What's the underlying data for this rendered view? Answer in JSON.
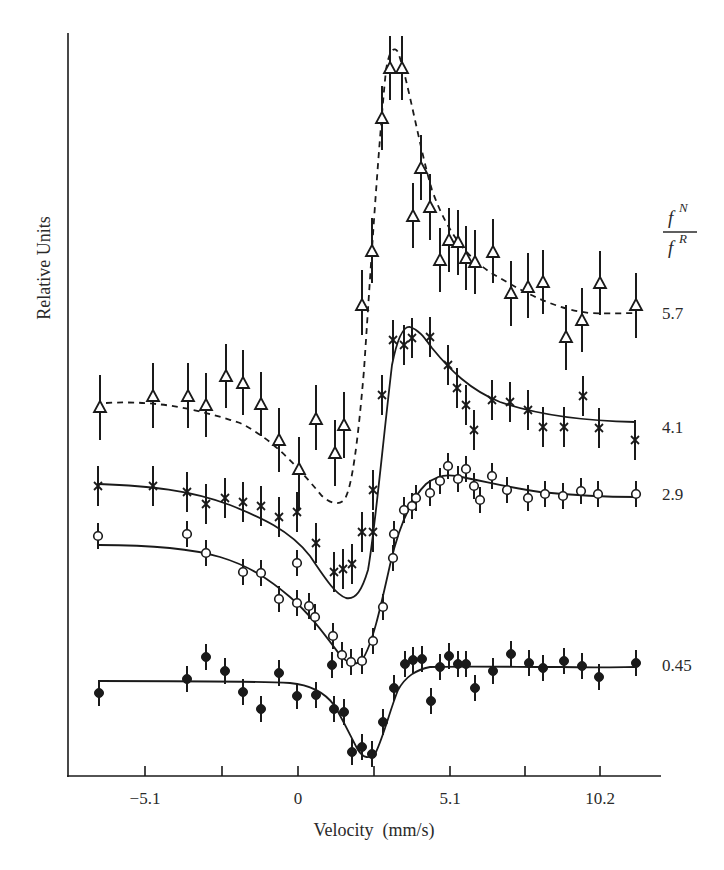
{
  "chart_data": {
    "type": "scatter",
    "title": "",
    "xlabel": "Velocity  (mm/s)",
    "ylabel": "Relative Units",
    "xlim": [
      -10.0,
      12.2
    ],
    "x_ticks": [
      -7.65,
      -5.1,
      -2.55,
      0,
      2.55,
      5.1,
      7.65,
      10.2
    ],
    "x_tick_labels": [
      "-5.1",
      "0",
      "5.1",
      "10.2"
    ],
    "x_tick_labels_positions": [
      -5.1,
      0,
      5.1,
      10.2
    ],
    "grid": false,
    "legend_title": "f^N / f^R",
    "legend_position": "right, aligned with each curve",
    "y_units": "relative (curves offset vertically, no y ticks)",
    "series": [
      {
        "name": "5.7",
        "marker": "open-triangle",
        "fit": "dashed",
        "x": [
          -6.6,
          -4.8,
          -3.7,
          -3.1,
          -2.4,
          -1.8,
          -1.2,
          -0.6,
          0.0,
          0.6,
          1.2,
          1.5,
          2.1,
          2.8,
          3.1,
          3.4,
          3.8,
          4.1,
          4.9,
          5.2,
          5.5,
          5.8,
          6.1,
          6.4,
          7.0,
          7.6,
          8.1,
          8.6,
          9.1,
          9.6,
          10.8
        ],
        "y": [
          5.75,
          5.85,
          5.85,
          5.77,
          6.0,
          5.95,
          5.77,
          5.45,
          5.2,
          5.6,
          5.35,
          5.55,
          6.55,
          6.75,
          7.95,
          8.4,
          8.4,
          7.55,
          6.55,
          6.75,
          6.3,
          6.5,
          6.5,
          6.35,
          6.3,
          6.4,
          5.95,
          6.0,
          6.05,
          5.6,
          5.8
        ],
        "yerr": 0.75
      },
      {
        "name": "4.1",
        "marker": "x-cross",
        "fit": "solid",
        "x": [
          -6.6,
          -4.8,
          -3.7,
          -3.1,
          -2.4,
          -1.8,
          -1.2,
          -0.6,
          0.0,
          0.6,
          1.2,
          1.5,
          1.8,
          2.5,
          2.1,
          2.8,
          3.2,
          3.5,
          4.1,
          4.4,
          5.0,
          5.3,
          5.6,
          5.9,
          6.5,
          7.1,
          7.6,
          8.1,
          8.8,
          9.5,
          10.8
        ],
        "y": [
          4.0,
          4.0,
          3.95,
          3.85,
          3.9,
          3.87,
          3.84,
          3.75,
          3.78,
          3.5,
          3.25,
          3.28,
          3.32,
          3.6,
          3.6,
          4.0,
          4.85,
          5.35,
          5.3,
          5.37,
          5.37,
          5.12,
          4.9,
          4.75,
          4.55,
          4.82,
          4.8,
          4.73,
          4.58,
          4.58,
          4.48
        ],
        "yerr": 0.4
      },
      {
        "name": "2.9",
        "marker": "open-circle",
        "fit": "solid",
        "x": [
          -6.6,
          -3.7,
          -3.1,
          -1.8,
          -1.2,
          -0.6,
          0.0,
          0.4,
          0.6,
          1.2,
          1.5,
          1.8,
          2.2,
          2.5,
          2.8,
          3.2,
          3.2,
          3.5,
          3.8,
          4.1,
          4.4,
          4.9,
          5.2,
          5.4,
          5.7,
          6.5,
          7.6,
          8.3,
          8.9,
          9.5,
          10.2,
          11.2
        ],
        "y": [
          2.9,
          2.92,
          2.75,
          2.58,
          2.57,
          2.35,
          2.32,
          2.28,
          2.15,
          1.98,
          1.82,
          1.75,
          1.76,
          1.97,
          2.27,
          2.48,
          2.68,
          2.7,
          2.8,
          2.9,
          3.0,
          2.96,
          3.1,
          3.0,
          2.94,
          3.02,
          3.08,
          3.0,
          3.03,
          3.04,
          3.0,
          3.04
        ],
        "yerr": 0.3
      },
      {
        "name": "0.45",
        "marker": "filled-circle",
        "fit": "solid",
        "x": [
          -6.7,
          -3.7,
          -3.1,
          -2.4,
          -1.8,
          -1.2,
          -0.6,
          0.0,
          0.6,
          1.2,
          1.2,
          1.6,
          1.8,
          2.2,
          2.5,
          2.5,
          2.9,
          3.2,
          3.6,
          3.8,
          4.2,
          4.5,
          4.8,
          5.1,
          5.4,
          5.7,
          6.0,
          6.6,
          7.2,
          7.8,
          8.3,
          8.8,
          9.4,
          10.0,
          11.2
        ],
        "y": [
          0.76,
          0.88,
          1.08,
          0.95,
          0.77,
          0.62,
          0.93,
          0.73,
          0.74,
          1.0,
          0.62,
          0.6,
          0.24,
          0.28,
          0.22,
          0.22,
          0.5,
          0.79,
          1.0,
          1.04,
          1.05,
          0.66,
          0.97,
          1.07,
          1.0,
          1.0,
          0.79,
          0.93,
          1.08,
          0.98,
          0.94,
          0.98,
          0.97,
          0.87,
          0.98
        ],
        "yerr": 0.3
      }
    ]
  },
  "axes": {
    "x_label": "Velocity  (mm/s)",
    "y_label": "Relative Units",
    "x_tick_labels": [
      {
        "label": "−5.1",
        "px": 145
      },
      {
        "label": "0",
        "px": 298
      },
      {
        "label": "5.1",
        "px": 450
      },
      {
        "label": "10.2",
        "px": 600
      }
    ]
  },
  "legend": {
    "numerator": "f",
    "numerator_sup": "N",
    "denominator": "f",
    "denominator_sup": "R",
    "series_labels": [
      {
        "label": "5.7",
        "py": 319
      },
      {
        "label": "4.1",
        "py": 433
      },
      {
        "label": "2.9",
        "py": 500
      },
      {
        "label": "0.45",
        "py": 671
      }
    ]
  },
  "plot_pixels": {
    "triangles": [
      [
        100,
        407
      ],
      [
        153,
        396
      ],
      [
        188,
        396
      ],
      [
        206,
        405
      ],
      [
        226,
        376
      ],
      [
        243,
        383
      ],
      [
        261,
        404
      ],
      [
        279,
        440
      ],
      [
        299,
        469
      ],
      [
        316,
        419
      ],
      [
        335,
        453
      ],
      [
        344,
        425
      ],
      [
        362,
        305
      ],
      [
        372,
        251
      ],
      [
        382,
        118
      ],
      [
        390,
        68
      ],
      [
        402,
        68
      ],
      [
        413,
        216
      ],
      [
        421,
        168
      ],
      [
        430,
        207
      ],
      [
        440,
        260
      ],
      [
        449,
        240
      ],
      [
        458,
        242
      ],
      [
        466,
        258
      ],
      [
        475,
        262
      ],
      [
        493,
        252
      ],
      [
        511,
        293
      ],
      [
        528,
        287
      ],
      [
        543,
        282
      ],
      [
        566,
        337
      ],
      [
        582,
        320
      ],
      [
        600,
        283
      ],
      [
        636,
        305
      ]
    ],
    "triangle_err": [
      [
        100,
        375,
        440
      ],
      [
        153,
        363,
        428
      ],
      [
        188,
        363,
        428
      ],
      [
        206,
        373,
        437
      ],
      [
        226,
        344,
        408
      ],
      [
        243,
        350,
        415
      ],
      [
        261,
        372,
        436
      ],
      [
        279,
        408,
        472
      ],
      [
        299,
        437,
        510
      ],
      [
        316,
        385,
        450
      ],
      [
        335,
        420,
        486
      ],
      [
        344,
        392,
        458
      ],
      [
        362,
        270,
        335
      ],
      [
        372,
        218,
        283
      ],
      [
        382,
        86,
        150
      ],
      [
        390,
        36,
        100
      ],
      [
        402,
        36,
        100
      ],
      [
        413,
        183,
        248
      ],
      [
        421,
        135,
        200
      ],
      [
        430,
        174,
        240
      ],
      [
        440,
        228,
        292
      ],
      [
        449,
        208,
        272
      ],
      [
        458,
        210,
        275
      ],
      [
        466,
        226,
        290
      ],
      [
        475,
        230,
        294
      ],
      [
        493,
        219,
        283
      ],
      [
        511,
        261,
        326
      ],
      [
        528,
        253,
        318
      ],
      [
        543,
        250,
        314
      ],
      [
        566,
        305,
        370
      ],
      [
        582,
        288,
        352
      ],
      [
        600,
        251,
        315
      ],
      [
        636,
        273,
        338
      ]
    ],
    "crosses": [
      [
        98,
        486
      ],
      [
        153,
        486
      ],
      [
        187,
        492
      ],
      [
        206,
        504
      ],
      [
        225,
        498
      ],
      [
        243,
        502
      ],
      [
        261,
        506
      ],
      [
        279,
        517
      ],
      [
        297,
        512
      ],
      [
        316,
        543
      ],
      [
        334,
        572
      ],
      [
        343,
        569
      ],
      [
        352,
        564
      ],
      [
        373,
        532
      ],
      [
        362,
        532
      ],
      [
        373,
        490
      ],
      [
        382,
        395
      ],
      [
        393,
        340
      ],
      [
        404,
        345
      ],
      [
        412,
        338
      ],
      [
        430,
        337
      ],
      [
        448,
        365
      ],
      [
        457,
        388
      ],
      [
        466,
        405
      ],
      [
        474,
        430
      ],
      [
        492,
        400
      ],
      [
        510,
        402
      ],
      [
        528,
        410
      ],
      [
        543,
        427
      ],
      [
        564,
        427
      ],
      [
        583,
        396
      ],
      [
        599,
        428
      ],
      [
        635,
        440
      ]
    ],
    "circles": [
      [
        98,
        536
      ],
      [
        187,
        534
      ],
      [
        206,
        553
      ],
      [
        243,
        572
      ],
      [
        261,
        573
      ],
      [
        279,
        599
      ],
      [
        297,
        563
      ],
      [
        297,
        603
      ],
      [
        309,
        606
      ],
      [
        315,
        617
      ],
      [
        333,
        636
      ],
      [
        342,
        655
      ],
      [
        351,
        662
      ],
      [
        362,
        661
      ],
      [
        373,
        641
      ],
      [
        383,
        607
      ],
      [
        393,
        558
      ],
      [
        394,
        534
      ],
      [
        404,
        510
      ],
      [
        412,
        506
      ],
      [
        416,
        498
      ],
      [
        430,
        493
      ],
      [
        440,
        481
      ],
      [
        448,
        466
      ],
      [
        458,
        479
      ],
      [
        466,
        469
      ],
      [
        474,
        486
      ],
      [
        480,
        500
      ],
      [
        492,
        476
      ],
      [
        507,
        490
      ],
      [
        528,
        498
      ],
      [
        545,
        494
      ],
      [
        563,
        496
      ],
      [
        581,
        491
      ],
      [
        598,
        494
      ],
      [
        636,
        494
      ]
    ],
    "dots": [
      [
        99,
        693
      ],
      [
        187,
        679
      ],
      [
        206,
        657
      ],
      [
        225,
        671
      ],
      [
        243,
        692
      ],
      [
        261,
        709
      ],
      [
        279,
        673
      ],
      [
        297,
        696
      ],
      [
        316,
        695
      ],
      [
        332,
        665
      ],
      [
        334,
        709
      ],
      [
        344,
        712
      ],
      [
        352,
        752
      ],
      [
        362,
        747
      ],
      [
        372,
        754
      ],
      [
        383,
        722
      ],
      [
        394,
        688
      ],
      [
        405,
        664
      ],
      [
        413,
        660
      ],
      [
        422,
        659
      ],
      [
        431,
        701
      ],
      [
        440,
        667
      ],
      [
        449,
        656
      ],
      [
        458,
        664
      ],
      [
        466,
        664
      ],
      [
        475,
        688
      ],
      [
        493,
        671
      ],
      [
        511,
        654
      ],
      [
        529,
        663
      ],
      [
        543,
        668
      ],
      [
        564,
        661
      ],
      [
        582,
        666
      ],
      [
        599,
        677
      ],
      [
        636,
        663
      ]
    ]
  }
}
